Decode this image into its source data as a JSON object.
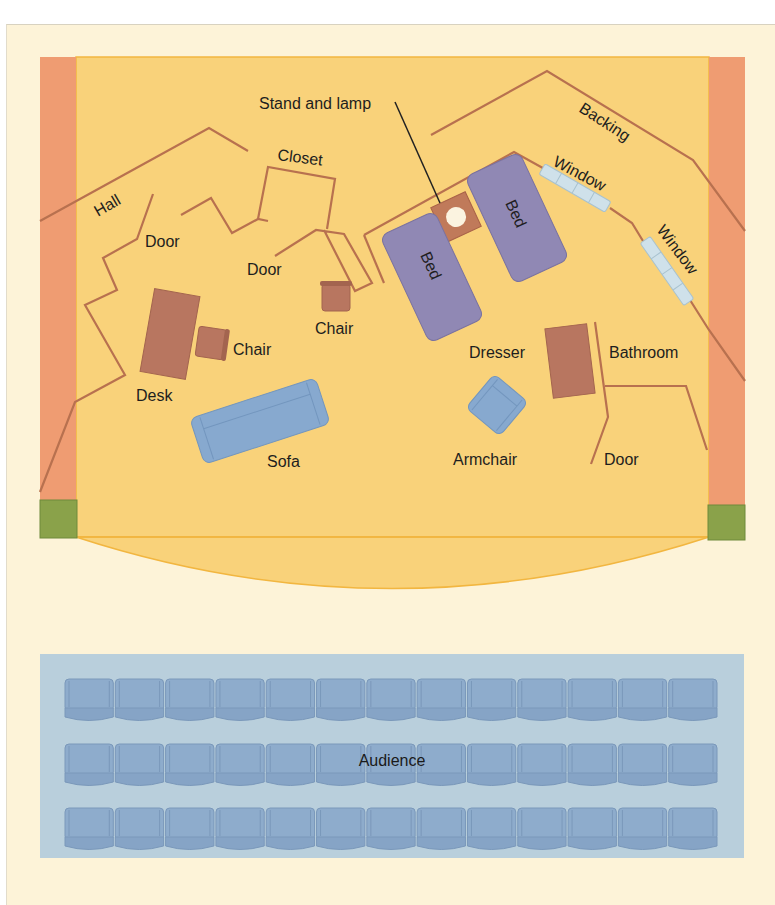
{
  "diagram": {
    "colors": {
      "page_bg": "#fdf3d8",
      "stage_floor": "#f9d27a",
      "stage_edge": "#f2b640",
      "proscenium_side": "#ef9c72",
      "corner_block": "#8aa24a",
      "wall_line": "#b8714f",
      "brown_furniture": "#b87660",
      "bed": "#9088b4",
      "blue_furniture": "#87a9cf",
      "window": "#cfe1ea",
      "audience_area": "#b9cfdc",
      "seat": "#8eaccc"
    },
    "labels": {
      "stand_and_lamp": "Stand and lamp",
      "backing": "Backing",
      "closet": "Closet",
      "hall": "Hall",
      "door_1": "Door",
      "door_2": "Door",
      "door_3": "Door",
      "window_1": "Window",
      "window_2": "Window",
      "bed_1": "Bed",
      "bed_2": "Bed",
      "chair_1": "Chair",
      "chair_2": "Chair",
      "desk": "Desk",
      "sofa": "Sofa",
      "dresser": "Dresser",
      "bathroom": "Bathroom",
      "armchair": "Armchair",
      "audience": "Audience"
    },
    "audience": {
      "rows": 3,
      "seats_per_row": 13
    }
  }
}
